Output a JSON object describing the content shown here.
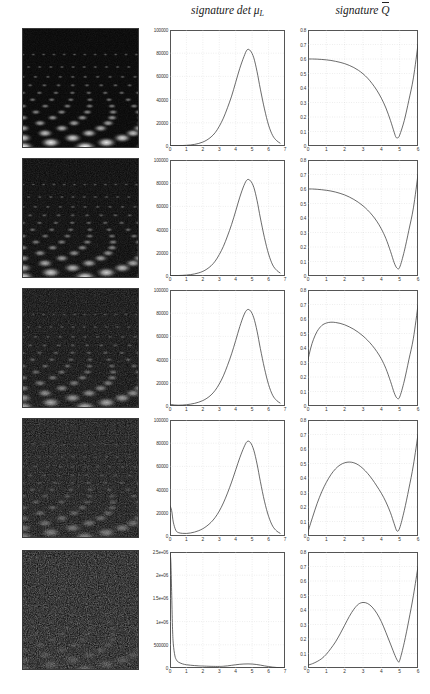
{
  "headers": {
    "left_col": "signature det",
    "left_col_symbol": "μ",
    "left_col_sub": "L",
    "right_col": "signature",
    "right_col_symbol": "Q"
  },
  "chart_data": [
    {
      "type": "line",
      "panel": "row1-left",
      "title": "signature det μ_L",
      "xlabel": "",
      "ylabel": "",
      "xlim": [
        0,
        7
      ],
      "ylim": [
        0,
        100000
      ],
      "xticks": [
        "0",
        "1",
        "2",
        "3",
        "4",
        "5",
        "6",
        "7"
      ],
      "yticks": [
        "0",
        "20000",
        "40000",
        "60000",
        "80000",
        "100000"
      ],
      "grid": true,
      "x": [
        0,
        0.25,
        0.5,
        0.75,
        1,
        1.25,
        1.5,
        1.75,
        2,
        2.25,
        2.5,
        2.75,
        3,
        3.25,
        3.5,
        3.75,
        4,
        4.25,
        4.5,
        4.7,
        4.9,
        5.1,
        5.3,
        5.5,
        5.75,
        6,
        6.25,
        6.5,
        6.7
      ],
      "values": [
        200,
        250,
        300,
        400,
        600,
        900,
        1400,
        2200,
        3400,
        5200,
        7800,
        11500,
        17000,
        24000,
        33000,
        43000,
        55000,
        67000,
        77000,
        83000,
        82000,
        76000,
        64000,
        49000,
        32000,
        18000,
        9000,
        4500,
        2500
      ]
    },
    {
      "type": "line",
      "panel": "row1-right",
      "title": "signature Q̄",
      "xlabel": "",
      "ylabel": "",
      "xlim": [
        0,
        6
      ],
      "ylim": [
        0,
        0.8
      ],
      "xticks": [
        "0",
        "1",
        "2",
        "3",
        "4",
        "5",
        "6"
      ],
      "yticks": [
        "0",
        "0.1",
        "0.2",
        "0.3",
        "0.4",
        "0.5",
        "0.6",
        "0.7",
        "0.8"
      ],
      "grid": true,
      "x": [
        0,
        0.25,
        0.5,
        0.75,
        1,
        1.25,
        1.5,
        1.75,
        2,
        2.25,
        2.5,
        2.75,
        3,
        3.25,
        3.5,
        3.75,
        4,
        4.25,
        4.5,
        4.7,
        4.8,
        4.9,
        5,
        5.25,
        5.5,
        5.75,
        6
      ],
      "values": [
        0.6,
        0.6,
        0.599,
        0.597,
        0.594,
        0.59,
        0.584,
        0.577,
        0.568,
        0.556,
        0.541,
        0.522,
        0.498,
        0.468,
        0.43,
        0.385,
        0.33,
        0.262,
        0.175,
        0.095,
        0.06,
        0.057,
        0.075,
        0.175,
        0.315,
        0.47,
        0.7
      ]
    },
    {
      "type": "line",
      "panel": "row2-left",
      "title": "signature det μ_L",
      "xlim": [
        0,
        7
      ],
      "ylim": [
        0,
        100000
      ],
      "xticks": [
        "0",
        "1",
        "2",
        "3",
        "4",
        "5",
        "6",
        "7"
      ],
      "yticks": [
        "0",
        "20000",
        "40000",
        "60000",
        "80000",
        "100000"
      ],
      "grid": true,
      "x": [
        0,
        0.25,
        0.5,
        0.75,
        1,
        1.25,
        1.5,
        1.75,
        2,
        2.25,
        2.5,
        2.75,
        3,
        3.25,
        3.5,
        3.75,
        4,
        4.25,
        4.5,
        4.7,
        4.9,
        5.1,
        5.3,
        5.5,
        5.75,
        6,
        6.25,
        6.5,
        6.7
      ],
      "values": [
        300,
        350,
        420,
        550,
        800,
        1200,
        1800,
        2700,
        4000,
        6000,
        8800,
        12800,
        18500,
        25500,
        34500,
        44500,
        56000,
        68000,
        78000,
        83000,
        82000,
        76500,
        65000,
        50000,
        33000,
        19000,
        9500,
        4800,
        2700
      ]
    },
    {
      "type": "line",
      "panel": "row2-right",
      "title": "signature Q̄",
      "xlim": [
        0,
        6
      ],
      "ylim": [
        0,
        0.8
      ],
      "xticks": [
        "0",
        "1",
        "2",
        "3",
        "4",
        "5",
        "6"
      ],
      "yticks": [
        "0",
        "0.1",
        "0.2",
        "0.3",
        "0.4",
        "0.5",
        "0.6",
        "0.7",
        "0.8"
      ],
      "grid": true,
      "x": [
        0,
        0.25,
        0.5,
        0.75,
        1,
        1.25,
        1.5,
        1.75,
        2,
        2.25,
        2.5,
        2.75,
        3,
        3.25,
        3.5,
        3.75,
        4,
        4.25,
        4.5,
        4.7,
        4.85,
        5,
        5.25,
        5.5,
        5.75,
        6
      ],
      "values": [
        0.6,
        0.6,
        0.598,
        0.595,
        0.591,
        0.586,
        0.579,
        0.57,
        0.559,
        0.545,
        0.528,
        0.508,
        0.484,
        0.455,
        0.42,
        0.378,
        0.325,
        0.258,
        0.17,
        0.092,
        0.055,
        0.06,
        0.17,
        0.315,
        0.47,
        0.7
      ]
    },
    {
      "type": "line",
      "panel": "row3-left",
      "title": "signature det μ_L",
      "xlim": [
        0,
        7
      ],
      "ylim": [
        0,
        100000
      ],
      "xticks": [
        "0",
        "1",
        "2",
        "3",
        "4",
        "5",
        "6",
        "7"
      ],
      "yticks": [
        "0",
        "20000",
        "40000",
        "60000",
        "80000",
        "100000"
      ],
      "grid": true,
      "x": [
        0,
        0.25,
        0.5,
        0.75,
        1,
        1.25,
        1.5,
        1.75,
        2,
        2.25,
        2.5,
        2.75,
        3,
        3.25,
        3.5,
        3.75,
        4,
        4.25,
        4.5,
        4.7,
        4.9,
        5.1,
        5.3,
        5.5,
        5.75,
        6,
        6.25,
        6.5,
        6.7
      ],
      "values": [
        1500,
        900,
        700,
        800,
        1100,
        1600,
        2300,
        3300,
        4700,
        6700,
        9500,
        13500,
        19000,
        26000,
        35000,
        45000,
        56500,
        68500,
        78500,
        83000,
        82000,
        76000,
        64500,
        49500,
        32500,
        18500,
        9200,
        4600,
        2600
      ]
    },
    {
      "type": "line",
      "panel": "row3-right",
      "title": "signature Q̄",
      "xlim": [
        0,
        6
      ],
      "ylim": [
        0,
        0.8
      ],
      "xticks": [
        "0",
        "1",
        "2",
        "3",
        "4",
        "5",
        "6"
      ],
      "yticks": [
        "0",
        "0.1",
        "0.2",
        "0.3",
        "0.4",
        "0.5",
        "0.6",
        "0.7",
        "0.8"
      ],
      "grid": true,
      "x": [
        0,
        0.15,
        0.3,
        0.5,
        0.75,
        1,
        1.25,
        1.5,
        1.75,
        2,
        2.25,
        2.5,
        2.75,
        3,
        3.25,
        3.5,
        3.75,
        4,
        4.25,
        4.5,
        4.7,
        4.85,
        5,
        5.25,
        5.5,
        5.75,
        6
      ],
      "values": [
        0.32,
        0.4,
        0.46,
        0.515,
        0.555,
        0.572,
        0.578,
        0.576,
        0.57,
        0.56,
        0.546,
        0.529,
        0.508,
        0.483,
        0.453,
        0.418,
        0.376,
        0.325,
        0.258,
        0.17,
        0.092,
        0.055,
        0.062,
        0.172,
        0.318,
        0.468,
        0.695
      ]
    },
    {
      "type": "line",
      "panel": "row4-left",
      "title": "signature det μ_L",
      "xlim": [
        0,
        7
      ],
      "ylim": [
        0,
        100000
      ],
      "xticks": [
        "0",
        "1",
        "2",
        "3",
        "4",
        "5",
        "6",
        "7"
      ],
      "yticks": [
        "0",
        "20000",
        "40000",
        "60000",
        "80000",
        "100000"
      ],
      "grid": true,
      "x": [
        0,
        0.1,
        0.2,
        0.35,
        0.5,
        0.75,
        1,
        1.25,
        1.5,
        1.75,
        2,
        2.25,
        2.5,
        2.75,
        3,
        3.25,
        3.5,
        3.75,
        4,
        4.25,
        4.5,
        4.7,
        4.9,
        5.1,
        5.3,
        5.5,
        5.75,
        6,
        6.25,
        6.5,
        6.7
      ],
      "values": [
        26000,
        22000,
        12000,
        5000,
        3000,
        2300,
        2200,
        2600,
        3400,
        4600,
        6300,
        8700,
        11800,
        16000,
        21500,
        28500,
        37000,
        46500,
        57000,
        67500,
        76500,
        81500,
        80500,
        74000,
        62000,
        47000,
        30000,
        17000,
        8500,
        4200,
        2400
      ]
    },
    {
      "type": "line",
      "panel": "row4-right",
      "title": "signature Q̄",
      "xlim": [
        0,
        6
      ],
      "ylim": [
        0,
        0.8
      ],
      "xticks": [
        "0",
        "1",
        "2",
        "3",
        "4",
        "5",
        "6"
      ],
      "yticks": [
        "0",
        "0.1",
        "0.2",
        "0.3",
        "0.4",
        "0.5",
        "0.6",
        "0.7",
        "0.8"
      ],
      "grid": true,
      "x": [
        0,
        0.25,
        0.5,
        0.75,
        1,
        1.25,
        1.5,
        1.75,
        2,
        2.25,
        2.5,
        2.75,
        3,
        3.25,
        3.5,
        3.75,
        4,
        4.25,
        4.5,
        4.7,
        4.85,
        5,
        5.25,
        5.5,
        5.75,
        6
      ],
      "values": [
        0.03,
        0.13,
        0.225,
        0.305,
        0.37,
        0.423,
        0.463,
        0.49,
        0.505,
        0.51,
        0.505,
        0.49,
        0.465,
        0.432,
        0.392,
        0.345,
        0.295,
        0.235,
        0.16,
        0.085,
        0.035,
        0.055,
        0.175,
        0.325,
        0.49,
        0.7
      ]
    },
    {
      "type": "line",
      "panel": "row5-left",
      "title": "signature det μ_L",
      "xlim": [
        0,
        7
      ],
      "ylim": [
        0,
        2500000
      ],
      "xticks": [
        "0",
        "1",
        "2",
        "3",
        "4",
        "5",
        "6",
        "7"
      ],
      "yticks": [
        "0",
        "500000",
        "1e+06",
        "1.5e+06",
        "2e+06",
        "2.5e+06"
      ],
      "grid": true,
      "x": [
        0,
        0.05,
        0.1,
        0.15,
        0.2,
        0.3,
        0.4,
        0.5,
        0.75,
        1,
        1.25,
        1.5,
        1.75,
        2,
        2.5,
        3,
        3.25,
        3.5,
        3.75,
        4,
        4.25,
        4.5,
        4.75,
        5,
        5.25,
        5.5,
        5.75,
        6,
        6.25,
        6.5,
        6.75,
        7
      ],
      "values": [
        2480000,
        2300000,
        1650000,
        900000,
        520000,
        260000,
        170000,
        130000,
        90000,
        70000,
        60000,
        52000,
        46000,
        42000,
        36000,
        34000,
        38000,
        46000,
        58000,
        70000,
        80000,
        86000,
        88000,
        85000,
        76000,
        62000,
        46000,
        31000,
        19000,
        11000,
        6000,
        3000
      ]
    },
    {
      "type": "line",
      "panel": "row5-right",
      "title": "signature Q̄",
      "xlim": [
        0,
        6
      ],
      "ylim": [
        0,
        0.8
      ],
      "xticks": [
        "0",
        "1",
        "2",
        "3",
        "4",
        "5",
        "6"
      ],
      "yticks": [
        "0",
        "0.1",
        "0.2",
        "0.3",
        "0.4",
        "0.5",
        "0.6",
        "0.7",
        "0.8"
      ],
      "grid": true,
      "x": [
        0,
        0.25,
        0.5,
        0.75,
        1,
        1.25,
        1.5,
        1.75,
        2,
        2.25,
        2.5,
        2.75,
        3,
        3.25,
        3.5,
        3.75,
        4,
        4.25,
        4.5,
        4.75,
        4.9,
        5,
        5.25,
        5.5,
        5.75,
        6
      ],
      "values": [
        0.02,
        0.03,
        0.045,
        0.065,
        0.095,
        0.135,
        0.18,
        0.235,
        0.295,
        0.355,
        0.405,
        0.44,
        0.452,
        0.445,
        0.42,
        0.378,
        0.32,
        0.245,
        0.165,
        0.085,
        0.048,
        0.052,
        0.175,
        0.33,
        0.5,
        0.7
      ]
    }
  ],
  "rows": [
    {
      "name": "row-1",
      "noise": 0.1,
      "brightness": 1.0
    },
    {
      "name": "row-2",
      "noise": 0.22,
      "brightness": 0.92
    },
    {
      "name": "row-3",
      "noise": 0.38,
      "brightness": 0.8
    },
    {
      "name": "row-4",
      "noise": 0.58,
      "brightness": 0.62
    },
    {
      "name": "row-5",
      "noise": 0.85,
      "brightness": 0.38
    }
  ]
}
